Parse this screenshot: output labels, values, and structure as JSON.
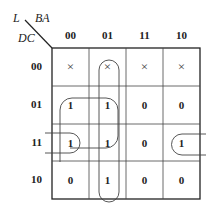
{
  "labels": {
    "output": "L",
    "col_vars": "BA",
    "row_vars": "DC"
  },
  "columns": [
    "00",
    "01",
    "11",
    "10"
  ],
  "rows": [
    "00",
    "01",
    "11",
    "10"
  ],
  "cells": [
    [
      "×",
      "×",
      "×",
      "×"
    ],
    [
      "1",
      "1",
      "0",
      "0"
    ],
    [
      "1",
      "1",
      "0",
      "1"
    ],
    [
      "0",
      "1",
      "0",
      "0"
    ]
  ],
  "groups": [
    {
      "name": "column-01-group",
      "cells": "col 01, rows 00-10"
    },
    {
      "name": "square-group",
      "cells": "cols 00-01, rows 01-11"
    },
    {
      "name": "wrap-group",
      "cells": "row 11, cols 00 and 10"
    }
  ]
}
